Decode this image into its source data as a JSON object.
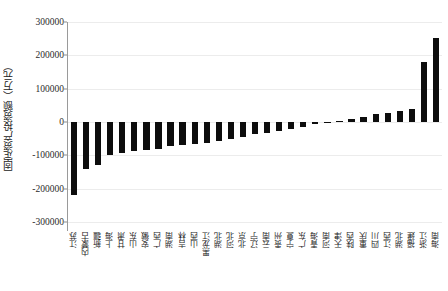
{
  "chart_data": {
    "type": "bar",
    "title": "",
    "subtitle": "",
    "xlabel": "",
    "ylabel": "固定资产投资额（万元）",
    "ylim": [
      -300000,
      300000
    ],
    "yticks": [
      300000,
      200000,
      100000,
      0,
      -100000,
      -200000,
      -300000
    ],
    "ytick_labels": [
      "300000",
      "200000",
      "100000",
      "0",
      "-100000",
      "-200000",
      "-300000"
    ],
    "grid": true,
    "legend": false,
    "legend_position": "none",
    "bar_color": "#0d0d0d",
    "categories": [
      "江苏",
      "内蒙古",
      "新疆",
      "上海",
      "甘肃",
      "山东",
      "安徽",
      "广西",
      "湖南",
      "吉林",
      "山西",
      "黑龙江",
      "湖北",
      "河北",
      "北京",
      "辽宁",
      "云南",
      "贵州",
      "宁夏",
      "广东",
      "青海",
      "河南",
      "天津",
      "陕西",
      "重庆",
      "四川",
      "江西",
      "湖北",
      "福建",
      "浙江",
      "海南"
    ],
    "values": [
      -218000,
      -140000,
      -128000,
      -100000,
      -92000,
      -86000,
      -84000,
      -80000,
      -73000,
      -70000,
      -66000,
      -62000,
      -58000,
      -52000,
      -44000,
      -36000,
      -32000,
      -27000,
      -21000,
      -14000,
      -7000,
      -2000,
      3000,
      9000,
      16000,
      23000,
      28000,
      33000,
      40000,
      181000,
      253000
    ],
    "n_bars": 31
  }
}
